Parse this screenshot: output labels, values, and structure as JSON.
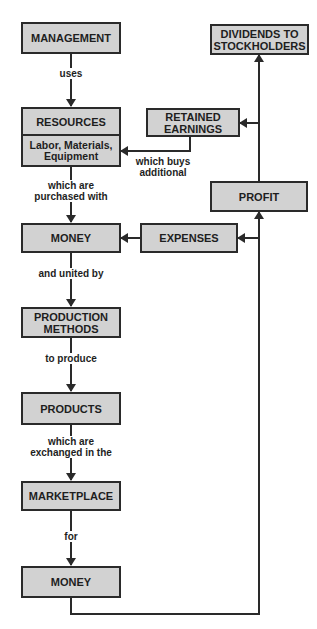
{
  "diagram": {
    "nodes": {
      "management": "MANAGEMENT",
      "resources": "RESOURCES",
      "resources_detail_1": "Labor, Materials,",
      "resources_detail_2": "Equipment",
      "money_1": "MONEY",
      "production_methods_1": "PRODUCTION",
      "production_methods_2": "METHODS",
      "products": "PRODUCTS",
      "marketplace": "MARKETPLACE",
      "money_2": "MONEY",
      "profit": "PROFIT",
      "expenses": "EXPENSES",
      "retained_earnings_1": "RETAINED",
      "retained_earnings_2": "EARNINGS",
      "dividends_1": "DIVIDENDS TO",
      "dividends_2": "STOCKHOLDERS"
    },
    "edge_labels": {
      "uses": "uses",
      "purchased_1": "which are",
      "purchased_2": "purchased with",
      "united": "and united by",
      "produce": "to produce",
      "exchanged_1": "which are",
      "exchanged_2": "exchanged in the",
      "for": "for",
      "buys_1": "which buys",
      "buys_2": "additional"
    },
    "edges": [
      {
        "from": "MANAGEMENT",
        "to": "RESOURCES",
        "label": "uses"
      },
      {
        "from": "RESOURCES",
        "to": "MONEY",
        "label": "which are purchased with"
      },
      {
        "from": "MONEY",
        "to": "PRODUCTION METHODS",
        "label": "and united by"
      },
      {
        "from": "PRODUCTION METHODS",
        "to": "PRODUCTS",
        "label": "to produce"
      },
      {
        "from": "PRODUCTS",
        "to": "MARKETPLACE",
        "label": "which are exchanged in the"
      },
      {
        "from": "MARKETPLACE",
        "to": "MONEY",
        "label": "for"
      },
      {
        "from": "MONEY",
        "to": "PROFIT",
        "label": ""
      },
      {
        "from": "MONEY",
        "to": "EXPENSES",
        "label": ""
      },
      {
        "from": "EXPENSES",
        "to": "MONEY",
        "label": ""
      },
      {
        "from": "PROFIT",
        "to": "RETAINED EARNINGS",
        "label": ""
      },
      {
        "from": "PROFIT",
        "to": "DIVIDENDS TO STOCKHOLDERS",
        "label": ""
      },
      {
        "from": "RETAINED EARNINGS",
        "to": "RESOURCES",
        "label": "which buys additional"
      }
    ],
    "colors": {
      "box_fill": "#d2d2d2",
      "line": "#2a2a2a",
      "background": "#ffffff"
    }
  }
}
